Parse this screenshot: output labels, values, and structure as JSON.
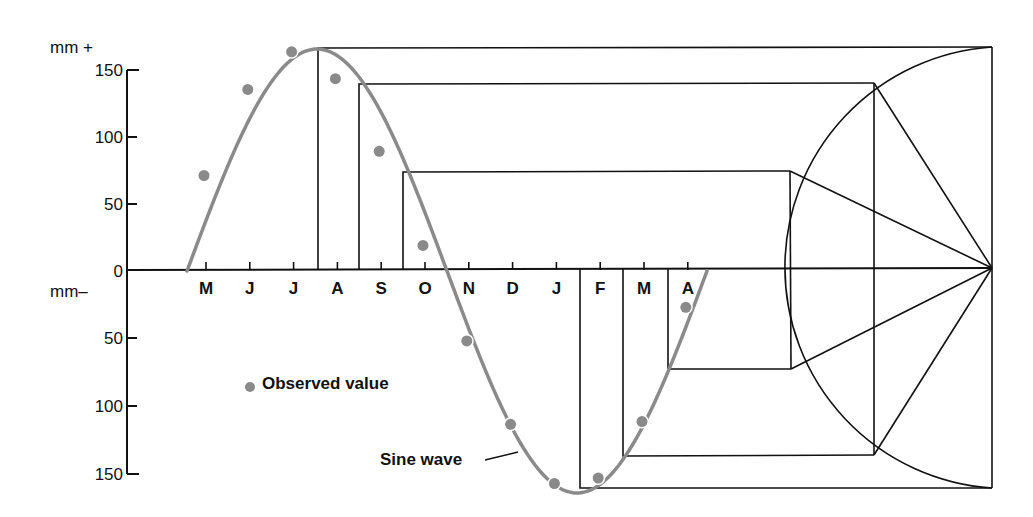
{
  "chart_data": {
    "type": "scatter",
    "title": "",
    "xlabel": "",
    "ylabel_top": "mm +",
    "ylabel_bottom": "mm–",
    "y_ticks_positive": [
      "150",
      "100",
      "50"
    ],
    "y_tick_zero": "0",
    "y_ticks_negative": [
      "50",
      "100",
      "150"
    ],
    "ylim": [
      -150,
      165
    ],
    "categories": [
      "M",
      "J",
      "J",
      "A",
      "S",
      "O",
      "N",
      "D",
      "J",
      "F",
      "M",
      "A"
    ],
    "series": [
      {
        "name": "Observed value",
        "type": "scatter",
        "values": [
          71,
          135,
          163,
          143,
          89,
          19,
          -52,
          -114,
          -158,
          -154,
          -112,
          -27
        ]
      },
      {
        "name": "Sine wave",
        "type": "line",
        "amplitude": 165,
        "period_months": 12,
        "description": "Fitted sine curve, zero crossing rising just before May, peak near late July, trough near late January"
      }
    ],
    "annotations": [
      "Phasor circle construction on right projecting sine values",
      "Sine wave label with leader line"
    ],
    "legend": {
      "observed_label": "Observed value",
      "sine_label": "Sine wave"
    },
    "grid": false,
    "colors": {
      "sine": "#8a8a8a",
      "observed": "#8a8a8a",
      "lines": "#111111"
    }
  }
}
